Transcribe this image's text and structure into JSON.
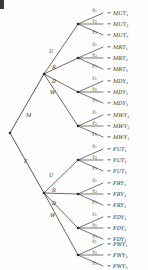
{
  "diagram": {
    "corner_mark": "",
    "equals_sign": "=",
    "root": {
      "label": "",
      "x": 10,
      "y": 133
    },
    "sex_branches": [
      {
        "label": "M",
        "label_x": 26,
        "label_y": 112,
        "node_x": 44,
        "node_y": 74
      },
      {
        "label": "F",
        "label_x": 24,
        "label_y": 158,
        "node_x": 44,
        "node_y": 193
      }
    ],
    "action_labels": [
      "U",
      "R",
      "D",
      "W"
    ],
    "gamma_labels": [
      "γ1",
      "γ2",
      "γ3"
    ],
    "groups": [
      {
        "sex": "M",
        "action": "U",
        "node_x": 78,
        "node_y": 24,
        "action_lbl_x": 49,
        "action_lbl_y": 48,
        "outcomes": [
          "MUT1",
          "MUT2",
          "MUT3"
        ]
      },
      {
        "sex": "M",
        "action": "R",
        "node_x": 78,
        "node_y": 58,
        "action_lbl_x": 52,
        "action_lbl_y": 64,
        "outcomes": [
          "MRT1",
          "MRT2",
          "MRT3"
        ]
      },
      {
        "sex": "M",
        "action": "D",
        "node_x": 78,
        "node_y": 92,
        "action_lbl_x": 52,
        "action_lbl_y": 78,
        "outcomes": [
          "MDY1",
          "MDY2",
          "MDY3"
        ]
      },
      {
        "sex": "M",
        "action": "W",
        "node_x": 78,
        "node_y": 126,
        "action_lbl_x": 50,
        "action_lbl_y": 89,
        "outcomes": [
          "MWY1",
          "MWY2",
          "MWY3"
        ]
      },
      {
        "sex": "F",
        "action": "U",
        "node_x": 78,
        "node_y": 160,
        "action_lbl_x": 49,
        "action_lbl_y": 172,
        "outcomes": [
          "FUT1",
          "FUT2",
          "FUT3"
        ]
      },
      {
        "sex": "F",
        "action": "R",
        "node_x": 78,
        "node_y": 194,
        "action_lbl_x": 52,
        "action_lbl_y": 187,
        "outcomes": [
          "FRY1",
          "FRY2",
          "FRY3"
        ]
      },
      {
        "sex": "F",
        "action": "D",
        "node_x": 78,
        "node_y": 228,
        "action_lbl_x": 52,
        "action_lbl_y": 200,
        "outcomes": [
          "FDY1",
          "FDY2",
          "FDY3"
        ]
      },
      {
        "sex": "F",
        "action": "W",
        "node_x": 78,
        "node_y": 255,
        "action_lbl_x": 50,
        "action_lbl_y": 212,
        "outcomes": [
          "FWY1",
          "FWY2",
          "FWY3"
        ]
      }
    ],
    "colors": {
      "line": "#2b2b2b",
      "text": "#1c1c1c",
      "background": "#fefefe"
    }
  }
}
